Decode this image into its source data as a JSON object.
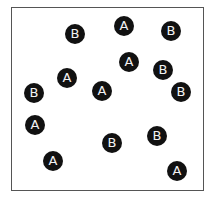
{
  "diagram": {
    "frame": {
      "left": 11,
      "top": 7,
      "width": 193,
      "height": 184
    },
    "dot_color": "#111111",
    "label_color": "#f2f2f2",
    "dots": [
      {
        "label": "B",
        "x": 75,
        "y": 34
      },
      {
        "label": "A",
        "x": 124,
        "y": 26
      },
      {
        "label": "B",
        "x": 171,
        "y": 31
      },
      {
        "label": "A",
        "x": 129,
        "y": 62
      },
      {
        "label": "B",
        "x": 163,
        "y": 70
      },
      {
        "label": "A",
        "x": 67,
        "y": 78
      },
      {
        "label": "B",
        "x": 34,
        "y": 93
      },
      {
        "label": "A",
        "x": 102,
        "y": 91
      },
      {
        "label": "B",
        "x": 181,
        "y": 92
      },
      {
        "label": "A",
        "x": 35,
        "y": 125
      },
      {
        "label": "B",
        "x": 157,
        "y": 136
      },
      {
        "label": "B",
        "x": 112,
        "y": 143
      },
      {
        "label": "A",
        "x": 53,
        "y": 161
      },
      {
        "label": "A",
        "x": 177,
        "y": 171
      }
    ]
  }
}
